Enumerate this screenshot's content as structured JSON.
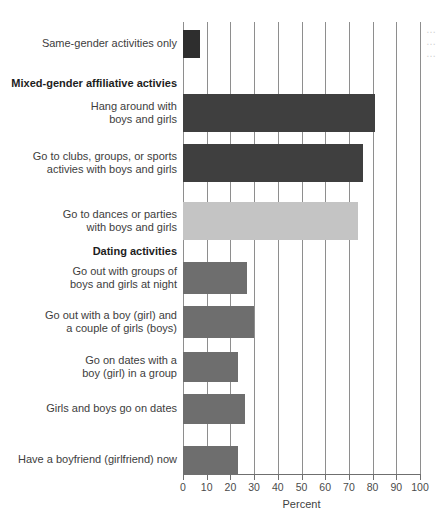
{
  "chart_data": {
    "type": "bar",
    "orientation": "horizontal",
    "title": "",
    "xlabel": "Percent",
    "ylabel": "",
    "xlim": [
      0,
      100
    ],
    "xticks": [
      0,
      10,
      20,
      30,
      40,
      50,
      60,
      70,
      80,
      90,
      100
    ],
    "grid": true,
    "legend": "none",
    "categories": [
      "Same-gender activities only",
      "Hang around with\nboys and girls",
      "Go to clubs, groups, or sports\nactivies with boys and girls",
      "Go to dances or parties\nwith boys and girls",
      "Go out with groups of\nboys and girls at night",
      "Go out with a boy (girl) and\na couple of girls (boys)",
      "Go on dates with a\nboy (girl) in a group",
      "Girls and boys go on dates",
      "Have a boyfriend (girlfriend) now"
    ],
    "values": [
      7,
      81,
      76,
      74,
      27,
      30,
      23,
      26,
      23
    ],
    "bar_colors": [
      "#2e2e2e",
      "#3f3f3f",
      "#3f3f3f",
      "#c4c4c4",
      "#6e6e6e",
      "#6e6e6e",
      "#6e6e6e",
      "#6e6e6e",
      "#6e6e6e"
    ],
    "group_headers": [
      {
        "label": "Mixed-gender affiliative activies",
        "before_index": 1
      },
      {
        "label": "Dating activities",
        "before_index": 4
      }
    ],
    "axis_color": "#6f6f6f",
    "gridline_color": "#8e8e8e",
    "background": "#ffffff"
  },
  "edge_note": "…\n…\n…"
}
